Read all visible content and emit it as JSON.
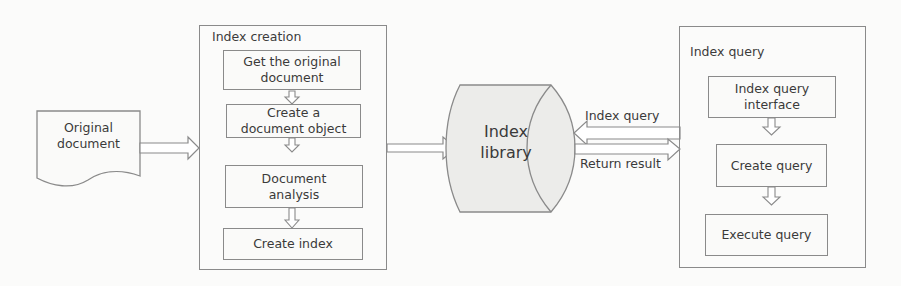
{
  "diagram": {
    "source": {
      "label": "Original\ndocument",
      "shape": "document"
    },
    "index_creation": {
      "title": "Index creation",
      "steps": [
        {
          "label": "Get the original\ndocument"
        },
        {
          "label": "Create a\ndocument object"
        },
        {
          "label": "Document\nanalysis"
        },
        {
          "label": "Create index"
        }
      ]
    },
    "library": {
      "label": "Index\nlibrary",
      "shape": "cylinder"
    },
    "connectors": {
      "query_label": "Index query",
      "result_label": "Return result"
    },
    "index_query": {
      "title": "Index query",
      "steps": [
        {
          "label": "Index query\ninterface"
        },
        {
          "label": "Create  query"
        },
        {
          "label": "Execute query"
        }
      ]
    }
  },
  "colors": {
    "stroke": "#8a8a8a",
    "fill": "#fafaf9",
    "cylinder_fill": "#ececea",
    "text": "#3a3a3a"
  }
}
